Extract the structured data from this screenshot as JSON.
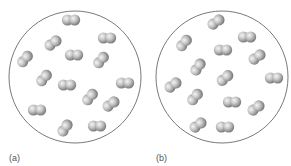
{
  "figure": {
    "colors": {
      "container_stroke": "#6a6a6a",
      "atom_light": "#eeeeee",
      "atom_mid": "#b0b0b0",
      "atom_dark": "#6e6e6e",
      "label": "#555555"
    },
    "panels": [
      {
        "label": "(a)",
        "label_pos": [
          9,
          153
        ],
        "container": {
          "cx": 75,
          "cy": 77,
          "r": 66
        },
        "molecules": [
          {
            "x": 71,
            "y": 20,
            "angle": 0
          },
          {
            "x": 53,
            "y": 43,
            "angle": -35
          },
          {
            "x": 107,
            "y": 38,
            "angle": 0
          },
          {
            "x": 25,
            "y": 59,
            "angle": -50
          },
          {
            "x": 74,
            "y": 55,
            "angle": 0
          },
          {
            "x": 101,
            "y": 60,
            "angle": -50
          },
          {
            "x": 44,
            "y": 78,
            "angle": -50
          },
          {
            "x": 67,
            "y": 85,
            "angle": 0
          },
          {
            "x": 125,
            "y": 83,
            "angle": 0
          },
          {
            "x": 90,
            "y": 97,
            "angle": -50
          },
          {
            "x": 111,
            "y": 104,
            "angle": -35
          },
          {
            "x": 37,
            "y": 110,
            "angle": 0
          },
          {
            "x": 65,
            "y": 128,
            "angle": -55
          },
          {
            "x": 97,
            "y": 126,
            "angle": 0
          }
        ]
      },
      {
        "label": "(b)",
        "label_pos": [
          156,
          153
        ],
        "container": {
          "cx": 222,
          "cy": 77,
          "r": 66
        },
        "molecules": [
          {
            "x": 216,
            "y": 22,
            "angle": -35
          },
          {
            "x": 184,
            "y": 43,
            "angle": -50
          },
          {
            "x": 247,
            "y": 37,
            "angle": 0
          },
          {
            "x": 223,
            "y": 50,
            "angle": 0
          },
          {
            "x": 257,
            "y": 57,
            "angle": -35
          },
          {
            "x": 198,
            "y": 67,
            "angle": -55
          },
          {
            "x": 173,
            "y": 85,
            "angle": -35
          },
          {
            "x": 225,
            "y": 78,
            "angle": -40
          },
          {
            "x": 274,
            "y": 78,
            "angle": 0
          },
          {
            "x": 195,
            "y": 97,
            "angle": -50
          },
          {
            "x": 232,
            "y": 102,
            "angle": 0
          },
          {
            "x": 256,
            "y": 108,
            "angle": -35
          },
          {
            "x": 198,
            "y": 125,
            "angle": -35
          },
          {
            "x": 225,
            "y": 127,
            "angle": 0
          }
        ]
      }
    ]
  }
}
